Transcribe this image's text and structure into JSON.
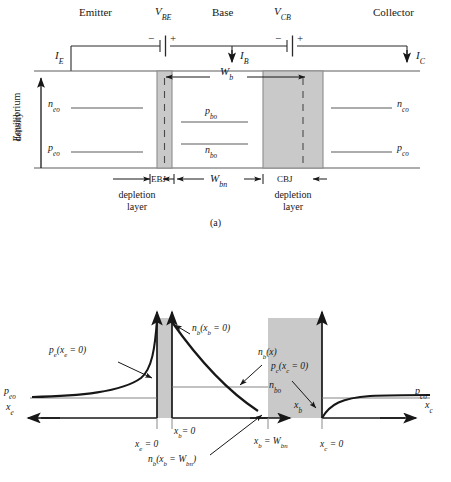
{
  "figure": {
    "title_a": "(a)",
    "colors": {
      "ink": "#171717",
      "depletion_fill": "#c9c9c9",
      "depletion_stroke": "#8c8c8c",
      "thin_line": "#6f6f6f",
      "background": "#ffffff"
    }
  },
  "panel_a": {
    "region_labels": [
      {
        "text": "Emitter",
        "x": 79,
        "y": 9
      },
      {
        "text": "Base",
        "x": 212,
        "y": 9
      },
      {
        "text": "Collector",
        "x": 373,
        "y": 9
      }
    ],
    "voltage_sources": [
      {
        "name": "V_BE",
        "base": "V",
        "sub": "BE",
        "x": 157,
        "y": 7,
        "minus": "−",
        "plus": "+"
      },
      {
        "name": "V_CB",
        "base": "V",
        "sub": "CB",
        "x": 276,
        "y": 7,
        "minus": "−",
        "plus": "+"
      }
    ],
    "currents": [
      {
        "base": "I",
        "sub": "E",
        "x": 57,
        "y": 41
      },
      {
        "base": "I",
        "sub": "B",
        "x": 228,
        "y": 41
      },
      {
        "base": "I",
        "sub": "C",
        "x": 419,
        "y": 41
      }
    ],
    "y_axis_label_line1": "Equilibrium",
    "y_axis_label_line2": "density",
    "density_levels": [
      {
        "base": "n",
        "sub": "eo",
        "x": 49,
        "y": 104,
        "line_x1": 71,
        "line_x2": 143,
        "line_y": 108
      },
      {
        "base": "p",
        "sub": "eo",
        "x": 49,
        "y": 148,
        "line_x1": 71,
        "line_x2": 143,
        "line_y": 152
      },
      {
        "base": "p",
        "sub": "bo",
        "x": 208,
        "y": 108,
        "line_x1": 181,
        "line_x2": 248,
        "line_y": 122
      },
      {
        "base": "n",
        "sub": "bo",
        "x": 208,
        "y": 147,
        "line_x1": 181,
        "line_x2": 248,
        "line_y": 144
      },
      {
        "base": "n",
        "sub": "co",
        "x": 399,
        "y": 104,
        "line_x1": 331,
        "line_x2": 392,
        "line_y": 108
      },
      {
        "base": "p",
        "sub": "co",
        "x": 399,
        "y": 148,
        "line_x1": 331,
        "line_x2": 392,
        "line_y": 152
      }
    ],
    "width_base": {
      "base": "W",
      "sub": "b",
      "x": 228,
      "y": 74
    },
    "width_base_neutral": {
      "base": "W",
      "sub": "bn",
      "x": 224,
      "y": 183
    },
    "junction_labels": [
      {
        "text": "EBJ",
        "x": 152,
        "y": 184
      },
      {
        "text": "CBJ",
        "x": 282,
        "y": 184
      }
    ],
    "depletion_captions": [
      {
        "line1": "depletion",
        "line2": "layer",
        "x": 135,
        "y": 199
      },
      {
        "line1": "depletion",
        "line2": "layer",
        "x": 265,
        "y": 199
      }
    ],
    "caption": "(a)"
  },
  "panel_b": {
    "curve_labels": [
      {
        "base": "p",
        "sub": "e",
        "tail": "(x",
        "tail_sub": "e",
        "tail2": " = 0)",
        "x": 50,
        "y": 354
      },
      {
        "base": "n",
        "sub": "b",
        "tail": "(x",
        "tail_sub": "b",
        "tail2": " = 0)",
        "x": 193,
        "y": 331
      },
      {
        "base": "n",
        "sub": "b",
        "tail": "(x)",
        "x": 259,
        "y": 355
      },
      {
        "base": "p",
        "sub": "c",
        "tail": "(x",
        "tail_sub": "c",
        "tail2": " = 0)",
        "x": 272,
        "y": 369
      },
      {
        "base": "n",
        "sub": "b",
        "tail": "(x",
        "tail_sub": "b",
        "tail2": " = W",
        "tail3_sub": "bn",
        "tail4": ")",
        "x": 174,
        "y": 462
      }
    ],
    "equilibrium_labels": [
      {
        "base": "p",
        "sub": "eo",
        "x": 5,
        "y": 393
      },
      {
        "base": "n",
        "sub": "bo",
        "x": 270,
        "y": 387
      },
      {
        "base": "p",
        "sub": "co",
        "x": 416,
        "y": 393
      }
    ],
    "axis_labels": [
      {
        "base": "x",
        "sub": "e",
        "x": 7,
        "y": 408
      },
      {
        "base": "x",
        "sub": "b",
        "x": 295,
        "y": 406
      },
      {
        "base": "x",
        "sub": "c",
        "x": 426,
        "y": 406
      }
    ],
    "tick_labels": [
      {
        "base": "x",
        "sub": "e",
        "tail": " = 0",
        "x": 138,
        "y": 434
      },
      {
        "base": "x",
        "sub": "b",
        "tail": "= 0",
        "x": 176,
        "y": 424
      },
      {
        "base": "x",
        "sub": "b",
        "tail": " = W",
        "tail_sub2": "bn",
        "x": 258,
        "y": 431
      },
      {
        "base": "x",
        "sub": "c",
        "tail": " = 0",
        "x": 323,
        "y": 434
      }
    ]
  }
}
